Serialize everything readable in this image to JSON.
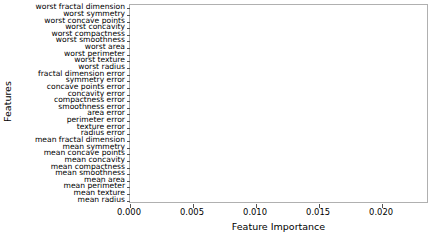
{
  "chart_data": {
    "type": "bar",
    "orientation": "horizontal",
    "title": "",
    "xlabel": "Feature Importance",
    "ylabel": "Features",
    "xlim": [
      0.0,
      0.02372
    ],
    "xticks": [
      0.0,
      0.005,
      0.01,
      0.015,
      0.02
    ],
    "xticklabels": [
      "0.000",
      "0.005",
      "0.010",
      "0.015",
      "0.020"
    ],
    "grid": false,
    "legend": null,
    "bar_color": "#000000",
    "categories": [
      "mean radius",
      "mean texture",
      "mean perimeter",
      "mean area",
      "mean smoothness",
      "mean compactness",
      "mean concavity",
      "mean concave points",
      "mean symmetry",
      "mean fractal dimension",
      "radius error",
      "texture error",
      "perimeter error",
      "area error",
      "smoothness error",
      "compactness error",
      "concavity error",
      "concave points error",
      "symmetry error",
      "fractal dimension error",
      "worst radius",
      "worst texture",
      "worst perimeter",
      "worst area",
      "worst smoothness",
      "worst compactness",
      "worst concavity",
      "worst concave points",
      "worst symmetry",
      "worst fractal dimension"
    ],
    "values": [
      0.0,
      0.00058,
      0.0,
      0.0,
      0.00082,
      0.0,
      0.0,
      0.00643,
      0.0,
      0.0,
      0.0,
      0.0,
      0.0,
      0.00183,
      0.0,
      0.0,
      0.0,
      0.0,
      0.0,
      0.0,
      0.0,
      0.01058,
      0.02276,
      0.00098,
      0.0,
      0.0,
      0.0,
      0.00102,
      0.0,
      0.0
    ]
  }
}
